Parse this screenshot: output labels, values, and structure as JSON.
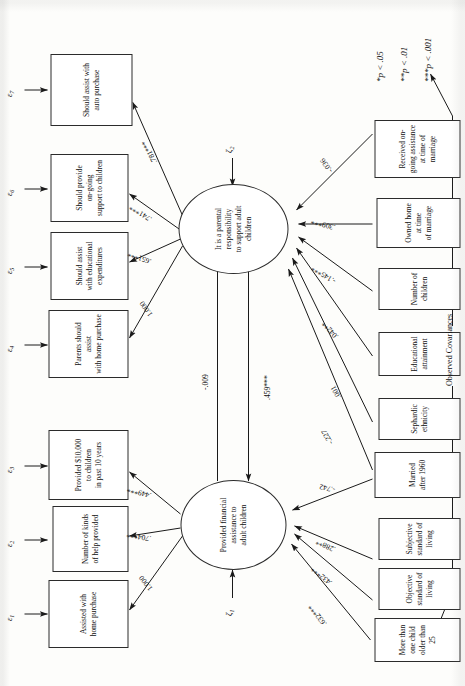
{
  "figure": {
    "type": "sem-path-diagram",
    "orientation": "rotated-90-counterclockwise",
    "covariance_label": "Observed Covariances",
    "footnotes": [
      "*p < .05",
      "**p < .01",
      "***p < .001"
    ]
  },
  "errors": [
    {
      "id": "e1",
      "glyph": "ε",
      "sub": "1"
    },
    {
      "id": "e2",
      "glyph": "ε",
      "sub": "2"
    },
    {
      "id": "e3",
      "glyph": "ε",
      "sub": "3"
    },
    {
      "id": "e4",
      "glyph": "ε",
      "sub": "4"
    },
    {
      "id": "e5",
      "glyph": "ε",
      "sub": "5"
    },
    {
      "id": "e6",
      "glyph": "ε",
      "sub": "6"
    },
    {
      "id": "e7",
      "glyph": "ε",
      "sub": "7"
    }
  ],
  "disturbances": [
    {
      "id": "z1",
      "glyph": "ζ",
      "sub": "1"
    },
    {
      "id": "z2",
      "glyph": "ζ",
      "sub": "2"
    }
  ],
  "indicators_left": [
    {
      "id": "y1",
      "label": "Assisted with\nhome purchase"
    },
    {
      "id": "y2",
      "label": "Number of kinds\nof help provided"
    },
    {
      "id": "y3",
      "label": "Provided $10,000\nto children\nin past 10 years"
    }
  ],
  "indicators_right": [
    {
      "id": "y4",
      "label": "Parents should assist\nwith home purchase"
    },
    {
      "id": "y5",
      "label": "Should assist\nwith educational\nexpenditures"
    },
    {
      "id": "y6",
      "label": "Should provide\non-going\nsupport to children"
    },
    {
      "id": "y7",
      "label": "Should assist with\nauto purchase"
    }
  ],
  "latents": [
    {
      "id": "eta1",
      "label": "Provided financial\nassistance to\nadult children"
    },
    {
      "id": "eta2",
      "label": "It is a parental\nresponsibility\nto support adult\nchildren"
    }
  ],
  "exogenous": [
    {
      "id": "x1",
      "label": "More than one child older than 25"
    },
    {
      "id": "x2",
      "label": "Objective standard of living"
    },
    {
      "id": "x3",
      "label": "Subjective standard of living"
    },
    {
      "id": "x4",
      "label": "Married after 1960"
    },
    {
      "id": "x5",
      "label": "Sephardic ethnicity"
    },
    {
      "id": "x6",
      "label": "Educational attainment"
    },
    {
      "id": "x7",
      "label": "Number of children"
    },
    {
      "id": "x8",
      "label": "Owned home at time\nof marriage"
    },
    {
      "id": "x9",
      "label": "Received on-going assistance\nat time of marriage"
    }
  ],
  "loadings_left": [
    {
      "from": "eta1",
      "to": "y1",
      "value": "1.000"
    },
    {
      "from": "eta1",
      "to": "y2",
      "value": ".704***"
    },
    {
      "from": "eta1",
      "to": "y3",
      "value": ".449***"
    }
  ],
  "loadings_right": [
    {
      "from": "eta2",
      "to": "y4",
      "value": "1.000"
    },
    {
      "from": "eta2",
      "to": "y5",
      "value": ".651***"
    },
    {
      "from": "eta2",
      "to": "y6",
      "value": ".741***"
    },
    {
      "from": "eta2",
      "to": "y7",
      "value": ".781***"
    }
  ],
  "structural_paths": [
    {
      "from": "eta1",
      "to": "eta2",
      "value": "-.009"
    },
    {
      "from": "eta2",
      "to": "eta1",
      "value": ".459***"
    }
  ],
  "exog_paths": [
    {
      "from": "x1",
      "to": "eta1",
      "value": ".632***"
    },
    {
      "from": "x2",
      "to": "eta1",
      "value": ".432***"
    },
    {
      "from": "x3",
      "to": "eta1",
      "value": ".288**"
    },
    {
      "from": "x4",
      "to": "eta1",
      "value": "-.742"
    },
    {
      "from": "x4",
      "to": "eta2",
      "value": "-.227"
    },
    {
      "from": "x5",
      "to": "eta2",
      "value": ".001"
    },
    {
      "from": "x6",
      "to": "eta2",
      "value": ".042**"
    },
    {
      "from": "x7",
      "to": "eta2",
      "value": "-.145***"
    },
    {
      "from": "x8",
      "to": "eta2",
      "value": ".309***"
    },
    {
      "from": "x9",
      "to": "eta2",
      "value": "-.036"
    }
  ],
  "chart_data": {
    "type": "diagram",
    "nodes": 20,
    "paths": 19
  }
}
